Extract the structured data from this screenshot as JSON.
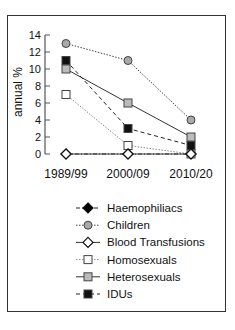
{
  "chart_data": {
    "type": "line",
    "title": "",
    "xlabel": "",
    "ylabel": "annual %",
    "ylim": [
      0,
      14
    ],
    "yticks": [
      0,
      2,
      4,
      6,
      8,
      10,
      12,
      14
    ],
    "categories": [
      "1989/99",
      "2000/09",
      "2010/20"
    ],
    "grid": false,
    "legend_position": "below plot",
    "series": [
      {
        "name": "Haemophiliacs",
        "values": [
          0,
          0,
          0
        ],
        "marker": "diamond",
        "fill": "#000000",
        "line": "dash-dot"
      },
      {
        "name": "Children",
        "values": [
          13,
          11,
          4
        ],
        "marker": "circle",
        "fill": "#aaaaaa",
        "line": "dotted"
      },
      {
        "name": "Blood Transfusions",
        "values": [
          0,
          0,
          0
        ],
        "marker": "diamond",
        "fill": "#ffffff",
        "line": "solid"
      },
      {
        "name": "Homosexuals",
        "values": [
          7,
          1,
          0
        ],
        "marker": "square",
        "fill": "#ffffff",
        "line": "dotted-light"
      },
      {
        "name": "Heterosexuals",
        "values": [
          10,
          6,
          2
        ],
        "marker": "square",
        "fill": "#bbbbbb",
        "line": "solid"
      },
      {
        "name": "IDUs",
        "values": [
          11,
          3,
          1
        ],
        "marker": "square",
        "fill": "#111111",
        "line": "dashed"
      }
    ]
  }
}
